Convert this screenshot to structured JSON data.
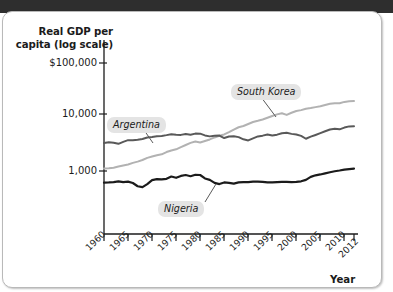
{
  "figure": {
    "kind": "economics-textbook-figure",
    "background_color": "#ffffff",
    "card_border_color": "#b9b9b9",
    "top_band_color": "#2e2e2e"
  },
  "chart_data": {
    "type": "line",
    "title": "",
    "ylabel": "Real GDP per capita (log scale)",
    "xlabel": "Year",
    "y_scale": "log",
    "ylim": [
      400,
      200000
    ],
    "xlim": [
      1960,
      2012
    ],
    "grid": false,
    "legend_position": "inline-callouts",
    "y_tick_labels": [
      "$100,000",
      "10,000",
      "1,000"
    ],
    "y_tick_values": [
      100000,
      10000,
      1000
    ],
    "x_tick_labels": [
      "1960",
      "1965",
      "1970",
      "1975",
      "1980",
      "1985",
      "1990",
      "1995",
      "2000",
      "2005",
      "2010",
      "2012"
    ],
    "x_tick_values": [
      1960,
      1965,
      1970,
      1975,
      1980,
      1985,
      1990,
      1995,
      2000,
      2005,
      2010,
      2012
    ],
    "series": [
      {
        "name": "Argentina",
        "color": "#595959",
        "label_text": "Argentina",
        "x": [
          1960,
          1961,
          1962,
          1963,
          1964,
          1965,
          1966,
          1967,
          1968,
          1969,
          1970,
          1971,
          1972,
          1973,
          1974,
          1975,
          1976,
          1977,
          1978,
          1979,
          1980,
          1981,
          1982,
          1983,
          1984,
          1985,
          1986,
          1987,
          1988,
          1989,
          1990,
          1991,
          1992,
          1993,
          1994,
          1995,
          1996,
          1997,
          1998,
          1999,
          2000,
          2001,
          2002,
          2003,
          2004,
          2005,
          2006,
          2007,
          2008,
          2009,
          2010,
          2011,
          2012
        ],
        "values": [
          3100,
          3200,
          3120,
          3000,
          3250,
          3480,
          3450,
          3520,
          3640,
          3860,
          3960,
          4080,
          4130,
          4260,
          4420,
          4320,
          4300,
          4460,
          4320,
          4530,
          4520,
          4210,
          4050,
          4150,
          4190,
          3790,
          4020,
          4080,
          3930,
          3600,
          3440,
          3740,
          4040,
          4170,
          4370,
          4180,
          4340,
          4600,
          4680,
          4480,
          4380,
          4130,
          3680,
          4000,
          4290,
          4620,
          4970,
          5340,
          5500,
          5380,
          5780,
          6060,
          6100
        ],
        "line_width": 2.0
      },
      {
        "name": "South Korea",
        "color": "#b2b2b2",
        "label_text": "South Korea",
        "x": [
          1960,
          1961,
          1962,
          1963,
          1964,
          1965,
          1966,
          1967,
          1968,
          1969,
          1970,
          1971,
          1972,
          1973,
          1974,
          1975,
          1976,
          1977,
          1978,
          1979,
          1980,
          1981,
          1982,
          1983,
          1984,
          1985,
          1986,
          1987,
          1988,
          1989,
          1990,
          1991,
          1992,
          1993,
          1994,
          1995,
          1996,
          1997,
          1998,
          1999,
          2000,
          2001,
          2002,
          2003,
          2004,
          2005,
          2006,
          2007,
          2008,
          2009,
          2010,
          2011,
          2012
        ],
        "values": [
          1110,
          1120,
          1140,
          1200,
          1250,
          1300,
          1390,
          1460,
          1560,
          1700,
          1790,
          1890,
          1960,
          2150,
          2290,
          2400,
          2620,
          2860,
          3110,
          3290,
          3160,
          3370,
          3580,
          3880,
          4140,
          4380,
          4810,
          5340,
          5860,
          6160,
          6680,
          7230,
          7590,
          8010,
          8590,
          9230,
          9850,
          10300,
          9650,
          10500,
          11300,
          11700,
          12400,
          12700,
          13200,
          13700,
          14400,
          15100,
          15400,
          15400,
          16300,
          16700,
          16900
        ],
        "line_width": 2.0
      },
      {
        "name": "Nigeria",
        "color": "#1b1b1b",
        "label_text": "Nigeria",
        "x": [
          1960,
          1961,
          1962,
          1963,
          1964,
          1965,
          1966,
          1967,
          1968,
          1969,
          1970,
          1971,
          1972,
          1973,
          1974,
          1975,
          1976,
          1977,
          1978,
          1979,
          1980,
          1981,
          1982,
          1983,
          1984,
          1985,
          1986,
          1987,
          1988,
          1989,
          1990,
          1991,
          1992,
          1993,
          1994,
          1995,
          1996,
          1997,
          1998,
          1999,
          2000,
          2001,
          2002,
          2003,
          2004,
          2005,
          2006,
          2007,
          2008,
          2009,
          2010,
          2011,
          2012
        ],
        "values": [
          625,
          630,
          640,
          660,
          640,
          650,
          615,
          540,
          520,
          590,
          690,
          720,
          715,
          730,
          800,
          760,
          820,
          850,
          810,
          860,
          850,
          740,
          700,
          620,
          590,
          630,
          620,
          600,
          630,
          640,
          640,
          650,
          650,
          645,
          630,
          630,
          640,
          645,
          645,
          640,
          645,
          660,
          700,
          790,
          840,
          870,
          910,
          950,
          990,
          1020,
          1060,
          1080,
          1100
        ],
        "line_width": 2.2
      }
    ],
    "annotations": [
      {
        "text": "Argentina",
        "target_year": 1972,
        "style": "italic-boxed-callout"
      },
      {
        "text": "South Korea",
        "target_year": 1987,
        "style": "italic-boxed-callout"
      },
      {
        "text": "Nigeria",
        "target_year": 1985,
        "style": "italic-boxed-callout"
      }
    ]
  }
}
